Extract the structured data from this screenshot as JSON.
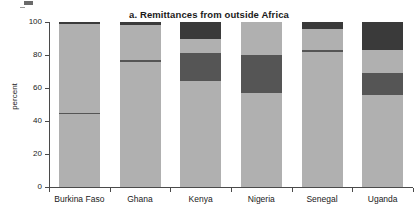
{
  "chart_data": {
    "type": "bar",
    "subtype": "stacked-percent",
    "title": "a. Remittances from outside Africa",
    "xlabel": "",
    "ylabel": "percent",
    "ylim": [
      0,
      100
    ],
    "yticks": [
      0,
      20,
      40,
      60,
      80,
      100
    ],
    "grid": false,
    "legend": "none",
    "categories": [
      "Burkina Faso",
      "Ghana",
      "Kenya",
      "Nigeria",
      "Senegal",
      "Uganda"
    ],
    "series": [
      {
        "name": "segment-1",
        "color": "#b0b0b0",
        "values": [
          44,
          76,
          64,
          57,
          82,
          56
        ]
      },
      {
        "name": "segment-2",
        "color": "#555555",
        "values": [
          1,
          1,
          17,
          23,
          1,
          13
        ]
      },
      {
        "name": "segment-3",
        "color": "#b0b0b0",
        "values": [
          54,
          21,
          9,
          20,
          13,
          14
        ]
      },
      {
        "name": "segment-4",
        "color": "#3a3a3a",
        "values": [
          1,
          2,
          10,
          0,
          4,
          17
        ]
      }
    ],
    "stack_tops": {
      "Burkina Faso": [
        44,
        45,
        99,
        100
      ],
      "Ghana": [
        76,
        77,
        98,
        100
      ],
      "Kenya": [
        64,
        81,
        90,
        100
      ],
      "Nigeria": [
        57,
        80,
        100,
        100
      ],
      "Senegal": [
        82,
        83,
        96,
        100
      ],
      "Uganda": [
        56,
        69,
        83,
        100
      ]
    }
  },
  "colors": {
    "light": "#b0b0b0",
    "mid": "#555555",
    "dark": "#3a3a3a",
    "axis": "#4a4a4a",
    "text": "#1a1a1a",
    "background": "#ffffff"
  },
  "axis": {
    "y_tick_labels": [
      "0",
      "20",
      "40",
      "60",
      "80",
      "100"
    ]
  }
}
